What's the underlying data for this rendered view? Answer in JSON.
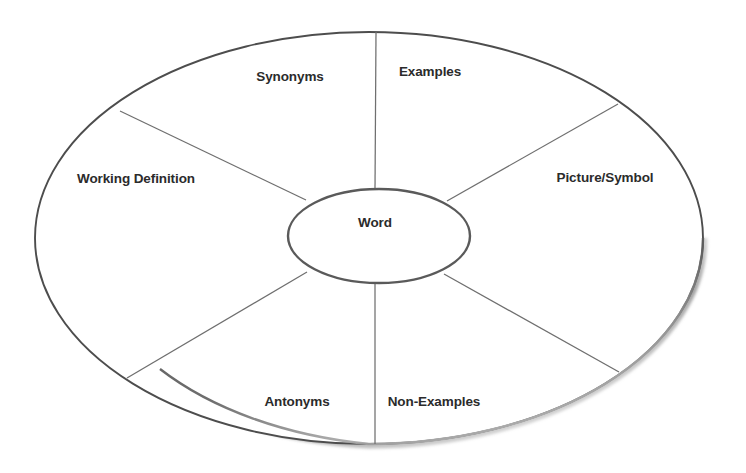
{
  "diagram": {
    "type": "word-wheel",
    "center": {
      "label": "Word"
    },
    "segments": [
      {
        "id": "synonyms",
        "label": "Synonyms",
        "x": 290,
        "y": 77
      },
      {
        "id": "examples",
        "label": "Examples",
        "x": 430,
        "y": 72
      },
      {
        "id": "picture-symbol",
        "label": "Picture/Symbol",
        "x": 605,
        "y": 178
      },
      {
        "id": "non-examples",
        "label": "Non-Examples",
        "x": 434,
        "y": 402
      },
      {
        "id": "antonyms",
        "label": "Antonyms",
        "x": 297,
        "y": 402
      },
      {
        "id": "working-definition",
        "label": "Working Definition",
        "x": 136,
        "y": 179
      }
    ],
    "geometry": {
      "outer": {
        "cx": 369,
        "cy": 238,
        "rx": 334,
        "ry": 206
      },
      "inner": {
        "cx": 379,
        "cy": 236,
        "rx": 91,
        "ry": 47
      },
      "spokes": [
        {
          "id": "spoke-top",
          "x1": 375,
          "y1": 189,
          "x2": 376,
          "y2": 32
        },
        {
          "id": "spoke-upper-right",
          "x1": 447,
          "y1": 201,
          "x2": 618,
          "y2": 104
        },
        {
          "id": "spoke-lower-right",
          "x1": 444,
          "y1": 274,
          "x2": 619,
          "y2": 372
        },
        {
          "id": "spoke-bottom",
          "x1": 375,
          "y1": 283,
          "x2": 375,
          "y2": 444
        },
        {
          "id": "spoke-lower-left",
          "x1": 307,
          "y1": 272,
          "x2": 127,
          "y2": 378
        },
        {
          "id": "spoke-upper-left",
          "x1": 306,
          "y1": 200,
          "x2": 120,
          "y2": 111
        }
      ]
    },
    "colors": {
      "background": "#ffffff",
      "outline": "#4d4d4d",
      "inner_outline": "#5a5a5a",
      "divider": "#6f6f6f",
      "text": "#2b2b2b",
      "shadow": "#9a9a9a"
    }
  }
}
